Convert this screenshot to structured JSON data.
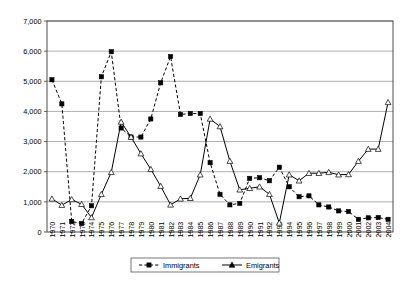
{
  "chart_data": {
    "type": "line",
    "title": "",
    "subtitle": "",
    "xlabel": "",
    "ylabel": "",
    "grid": true,
    "legend_position": "bottom-center",
    "ylim": [
      0,
      7000
    ],
    "yticks": [
      "0",
      "1,000",
      "2,000",
      "3,000",
      "4,000",
      "5,000",
      "6,000",
      "7,000"
    ],
    "ytick_values": [
      0,
      1000,
      2000,
      3000,
      4000,
      5000,
      6000,
      7000
    ],
    "categories": [
      "1970",
      "1971",
      "1972",
      "1973",
      "1974",
      "1975",
      "1976",
      "1977",
      "1978",
      "1979",
      "1980",
      "1981",
      "1982",
      "1983",
      "1984",
      "1985",
      "1986",
      "1987",
      "1988",
      "1989",
      "1990",
      "1991",
      "1992",
      "1993",
      "1994",
      "1995",
      "1996",
      "1997",
      "1998",
      "1999",
      "2000",
      "2001",
      "2002",
      "2003",
      "2004"
    ],
    "series": [
      {
        "name": "Immigrants",
        "marker": "filled-square",
        "line_style": "dashed",
        "color": "#000000",
        "values": [
          5050,
          4250,
          350,
          280,
          870,
          5150,
          5980,
          3450,
          3150,
          3150,
          3750,
          4950,
          5820,
          3900,
          3930,
          3930,
          2300,
          1250,
          900,
          950,
          1780,
          1800,
          1700,
          2150,
          1500,
          1170,
          1200,
          900,
          830,
          700,
          680,
          420,
          470,
          480,
          420
        ]
      },
      {
        "name": "Emigrants",
        "marker": "triangle",
        "line_style": "solid",
        "color": "#000000",
        "values": [
          1100,
          890,
          1080,
          920,
          480,
          1250,
          1980,
          3650,
          3150,
          2600,
          2080,
          1520,
          900,
          1100,
          1120,
          1900,
          3750,
          3500,
          2350,
          1400,
          1450,
          1500,
          1250,
          300,
          1900,
          1700,
          1950,
          1950,
          1980,
          1900,
          1910,
          2350,
          2750,
          2750,
          4300
        ]
      }
    ],
    "legend": [
      {
        "label": "Immigrants",
        "marker": "filled-square",
        "line_style": "dashed"
      },
      {
        "label": "Emigrants",
        "marker": "triangle",
        "line_style": "solid"
      }
    ]
  }
}
